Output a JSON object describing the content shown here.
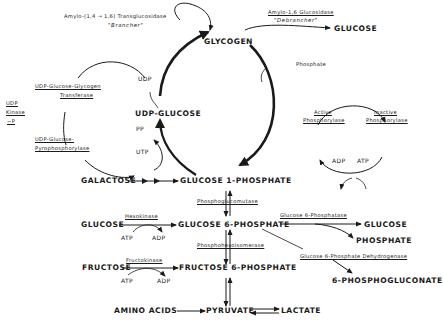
{
  "compounds": {
    "glycogen": "GLYCOGEN",
    "glucose_top": "GLUCOSE",
    "udp_glucose": "UDP-GLUCOSE",
    "galactose": "GALACTOSE",
    "glucose_1p": "GLUCOSE 1-PHOSPHATE",
    "glucose_left": "GLUCOSE",
    "glucose_6p": "GLUCOSE 6-PHOSPHATE",
    "glucose_right": "GLUCOSE",
    "phosphate": "PHOSPHATE",
    "fructose": "FRUCTOSE",
    "fructose_6p": "FRUCTOSE 6-PHOSPHATE",
    "phosphogluconate": "6-PHOSPHOGLUCONATE",
    "amino_acids": "AMINO ACIDS",
    "pyruvate": "PYRUVATE",
    "lactate": "LACTATE"
  },
  "enzymes": {
    "brancher_name": "Amylo-(1,4 → 1,6) Transglucosidase",
    "brancher_alias": "\"Brancher\"",
    "debrancher_name": "Amylo-1,6 Glucosidase",
    "debrancher_alias": "\"Debrancher\"",
    "glycogen_transferase_line1": "UDP-Glucose-Glycogen",
    "glycogen_transferase_line2": "Transferase",
    "pyrophosphorylase_line1": "UDP-Glucose-",
    "pyrophosphorylase_line2": "Pyrophosphorylase",
    "udp_kinase_line1": "UDP",
    "udp_kinase_line2": "Kinase",
    "udp_kinase_line3": "~P",
    "active_phosphorylase_line1": "Active",
    "active_phosphorylase_line2": "Phosphorylase",
    "inactive_phosphorylase_line1": "Inactive",
    "inactive_phosphorylase_line2": "Phosphorylase",
    "phosphoglucomutase": "Phosphoglucomutase",
    "hexokinase": "Hexokinase",
    "phosphohexoisomerase": "Phosphohexoisomerase",
    "fructokinase": "Fructokinase",
    "glucose_6_phosphatase": "Glucose 6-Phosphatase",
    "g6p_dehydrogenase": "Glucose 6-Phosphate Dehydrogenase"
  },
  "cofactors": {
    "udp": "UDP",
    "pp": "PP",
    "utp": "UTP",
    "phosphate": "Phosphate",
    "adp_phos": "ADP",
    "atp_phos": "ATP",
    "atp_hexo": "ATP",
    "adp_hexo": "ADP",
    "atp_fructo": "ATP",
    "adp_fructo": "ADP"
  }
}
